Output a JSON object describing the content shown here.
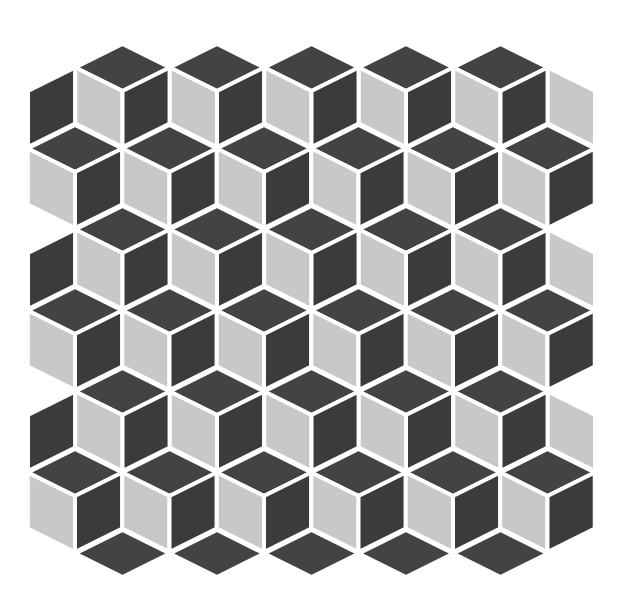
{
  "title": "Tumbling blocks tile mosaic",
  "colors": {
    "background": "#ffffff",
    "grout": "#ffffff",
    "top_face": "#434343",
    "left_face": "#c8c8c8",
    "right_face": "#3b3b3b"
  },
  "geometry": {
    "half_width": 47.25,
    "half_height": 23.5,
    "side_height": 56,
    "grout_width": 4
  },
  "rows": [
    {
      "y": 44,
      "cubes": [
        {
          "x": 28,
          "faces": [
            "right"
          ]
        },
        {
          "x": 122.5,
          "faces": [
            "top",
            "left",
            "right"
          ]
        },
        {
          "x": 217,
          "faces": [
            "top",
            "left",
            "right"
          ]
        },
        {
          "x": 311.5,
          "faces": [
            "top",
            "left",
            "right"
          ]
        },
        {
          "x": 406,
          "faces": [
            "top",
            "left",
            "right"
          ]
        },
        {
          "x": 500.5,
          "faces": [
            "top",
            "left",
            "right"
          ]
        },
        {
          "x": 595,
          "faces": [
            "left"
          ]
        }
      ]
    },
    {
      "y": 125,
      "cubes": [
        {
          "x": 75,
          "faces": [
            "top",
            "left",
            "right"
          ]
        },
        {
          "x": 169.5,
          "faces": [
            "top",
            "left",
            "right"
          ]
        },
        {
          "x": 264,
          "faces": [
            "top",
            "left",
            "right"
          ]
        },
        {
          "x": 358.5,
          "faces": [
            "top",
            "left",
            "right"
          ]
        },
        {
          "x": 453,
          "faces": [
            "top",
            "left",
            "right"
          ]
        },
        {
          "x": 547.5,
          "faces": [
            "top",
            "left",
            "right"
          ]
        }
      ]
    },
    {
      "y": 206,
      "cubes": [
        {
          "x": 28,
          "faces": [
            "right"
          ]
        },
        {
          "x": 122.5,
          "faces": [
            "top",
            "left",
            "right"
          ]
        },
        {
          "x": 217,
          "faces": [
            "top",
            "left",
            "right"
          ]
        },
        {
          "x": 311.5,
          "faces": [
            "top",
            "left",
            "right"
          ]
        },
        {
          "x": 406,
          "faces": [
            "top",
            "left",
            "right"
          ]
        },
        {
          "x": 500.5,
          "faces": [
            "top",
            "left",
            "right"
          ]
        },
        {
          "x": 595,
          "faces": [
            "left"
          ]
        }
      ]
    },
    {
      "y": 287,
      "cubes": [
        {
          "x": 75,
          "faces": [
            "top",
            "left",
            "right"
          ]
        },
        {
          "x": 169.5,
          "faces": [
            "top",
            "left",
            "right"
          ]
        },
        {
          "x": 264,
          "faces": [
            "top",
            "left",
            "right"
          ]
        },
        {
          "x": 358.5,
          "faces": [
            "top",
            "left",
            "right"
          ]
        },
        {
          "x": 453,
          "faces": [
            "top",
            "left",
            "right"
          ]
        },
        {
          "x": 547.5,
          "faces": [
            "top",
            "left",
            "right"
          ]
        }
      ]
    },
    {
      "y": 368,
      "cubes": [
        {
          "x": 28,
          "faces": [
            "right"
          ]
        },
        {
          "x": 122.5,
          "faces": [
            "top",
            "left",
            "right"
          ]
        },
        {
          "x": 217,
          "faces": [
            "top",
            "left",
            "right"
          ]
        },
        {
          "x": 311.5,
          "faces": [
            "top",
            "left",
            "right"
          ]
        },
        {
          "x": 406,
          "faces": [
            "top",
            "left",
            "right"
          ]
        },
        {
          "x": 500.5,
          "faces": [
            "top",
            "left",
            "right"
          ]
        },
        {
          "x": 595,
          "faces": [
            "left"
          ]
        }
      ]
    },
    {
      "y": 449,
      "cubes": [
        {
          "x": 75,
          "faces": [
            "top",
            "left",
            "right"
          ]
        },
        {
          "x": 169.5,
          "faces": [
            "top",
            "left",
            "right"
          ]
        },
        {
          "x": 264,
          "faces": [
            "top",
            "left",
            "right"
          ]
        },
        {
          "x": 358.5,
          "faces": [
            "top",
            "left",
            "right"
          ]
        },
        {
          "x": 453,
          "faces": [
            "top",
            "left",
            "right"
          ]
        },
        {
          "x": 547.5,
          "faces": [
            "top",
            "left",
            "right"
          ]
        }
      ]
    },
    {
      "y": 530,
      "cubes": [
        {
          "x": 122.5,
          "faces": [
            "top"
          ]
        },
        {
          "x": 217,
          "faces": [
            "top"
          ]
        },
        {
          "x": 311.5,
          "faces": [
            "top"
          ]
        },
        {
          "x": 406,
          "faces": [
            "top"
          ]
        },
        {
          "x": 500.5,
          "faces": [
            "top"
          ]
        }
      ]
    }
  ]
}
